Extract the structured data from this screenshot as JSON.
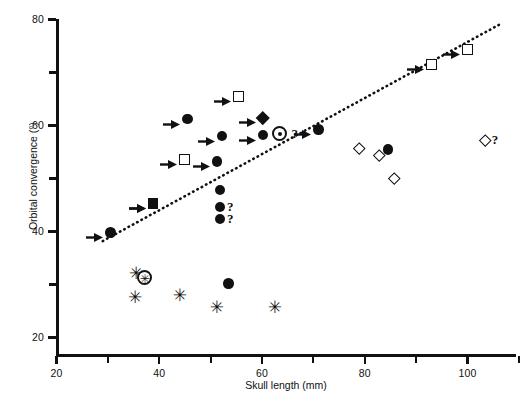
{
  "chart_data": {
    "type": "scatter",
    "title": "",
    "xlabel": "Skull length (mm)",
    "ylabel": "Orbital convergence (°)",
    "xlim": [
      20,
      110
    ],
    "ylim": [
      20,
      80
    ],
    "xticks": [
      20,
      40,
      60,
      80,
      100
    ],
    "xticks_minor": [
      30,
      50,
      70,
      90,
      110
    ],
    "yticks": [
      20,
      40,
      60,
      80
    ],
    "yticks_minor": [
      30,
      50,
      70
    ],
    "grid": false,
    "legend": "none",
    "xtick_labels": [
      "20",
      "40",
      "60",
      "80",
      "100"
    ],
    "ytick_labels": [
      "20",
      "40",
      "60",
      "80"
    ],
    "trend_line": {
      "style": "dotted",
      "x_start": 29.0,
      "y_start": 38.2,
      "x_end": 106.5,
      "y_end": 79.2
    },
    "series": [
      {
        "name": "filled-circle",
        "marker": "filled-circle",
        "points": [
          {
            "x": 30.5,
            "y": 39.8,
            "arrow": true,
            "q": false
          },
          {
            "x": 38.8,
            "y": 45.3,
            "arrow": true,
            "q": false
          },
          {
            "x": 45.5,
            "y": 61.2,
            "arrow": true,
            "q": false
          },
          {
            "x": 51.2,
            "y": 53.2,
            "arrow": true,
            "q": false
          },
          {
            "x": 52.2,
            "y": 58.0,
            "arrow": true,
            "q": false
          },
          {
            "x": 51.8,
            "y": 47.8,
            "arrow": false,
            "q": false
          },
          {
            "x": 51.8,
            "y": 44.6,
            "arrow": false,
            "q": true
          },
          {
            "x": 51.8,
            "y": 42.4,
            "arrow": false,
            "q": true
          },
          {
            "x": 53.5,
            "y": 30.2,
            "arrow": false,
            "q": false
          },
          {
            "x": 60.2,
            "y": 58.2,
            "arrow": true,
            "q": false
          },
          {
            "x": 71.0,
            "y": 59.2,
            "arrow": true,
            "q": false
          },
          {
            "x": 84.5,
            "y": 55.5,
            "arrow": false,
            "q": false
          }
        ]
      },
      {
        "name": "open-square",
        "marker": "open-square",
        "points": [
          {
            "x": 45.0,
            "y": 53.5,
            "arrow": true,
            "q": false
          },
          {
            "x": 55.5,
            "y": 65.5,
            "arrow": true,
            "q": false
          },
          {
            "x": 93.0,
            "y": 71.5,
            "arrow": true,
            "q": false
          },
          {
            "x": 100.0,
            "y": 74.3,
            "arrow": true,
            "q": false
          }
        ]
      },
      {
        "name": "filled-square",
        "marker": "filled-square",
        "points": [
          {
            "x": 38.8,
            "y": 45.3,
            "arrow": true,
            "q": false
          }
        ]
      },
      {
        "name": "filled-diamond",
        "marker": "filled-diamond",
        "points": [
          {
            "x": 60.2,
            "y": 61.5,
            "arrow": true,
            "q": false
          }
        ]
      },
      {
        "name": "bullseye",
        "marker": "bullseye",
        "points": [
          {
            "x": 63.5,
            "y": 58.4,
            "arrow": false,
            "q": true
          }
        ]
      },
      {
        "name": "open-diamond",
        "marker": "open-diamond",
        "points": [
          {
            "x": 79.0,
            "y": 55.8,
            "arrow": false,
            "q": false
          },
          {
            "x": 82.8,
            "y": 54.4,
            "arrow": false,
            "q": false
          },
          {
            "x": 85.8,
            "y": 50.0,
            "arrow": false,
            "q": false
          },
          {
            "x": 103.5,
            "y": 57.3,
            "arrow": false,
            "q": true
          }
        ]
      },
      {
        "name": "asterisk",
        "marker": "asterisk",
        "points": [
          {
            "x": 35.5,
            "y": 32.3,
            "arrow": false,
            "q": false
          },
          {
            "x": 35.3,
            "y": 27.8,
            "arrow": false,
            "q": false
          },
          {
            "x": 44.0,
            "y": 28.2,
            "arrow": false,
            "q": false
          },
          {
            "x": 51.2,
            "y": 25.8,
            "arrow": false,
            "q": false
          },
          {
            "x": 62.5,
            "y": 25.8,
            "arrow": false,
            "q": false
          }
        ]
      },
      {
        "name": "circled-asterisk",
        "marker": "circled-asterisk",
        "points": [
          {
            "x": 37.2,
            "y": 31.4,
            "arrow": false,
            "q": false
          }
        ]
      }
    ],
    "annotations": [
      {
        "text": "?",
        "meaning": "uncertain-value-marker"
      }
    ]
  },
  "axes": {
    "x_title": "Skull length (mm)",
    "y_title": "Orbital convergence (°)",
    "x_labels": [
      "20",
      "40",
      "60",
      "80",
      "100"
    ],
    "y_labels": [
      "20",
      "40",
      "60",
      "80"
    ]
  },
  "labels": {
    "question_mark": "?"
  },
  "colors": {
    "ink": "#111111",
    "background": "#ffffff"
  }
}
